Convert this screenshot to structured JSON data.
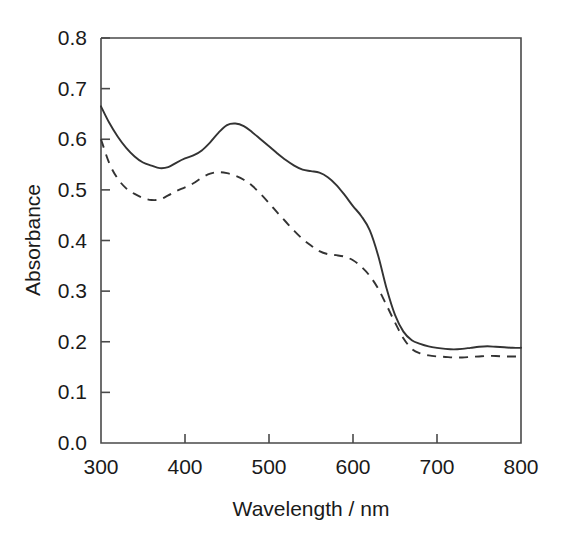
{
  "chart_data": {
    "type": "line",
    "title": "",
    "xlabel": "Wavelength / nm",
    "ylabel": "Absorbance",
    "xlim": [
      300,
      800
    ],
    "ylim": [
      0.0,
      0.8
    ],
    "xticks": [
      300,
      400,
      500,
      600,
      700,
      800
    ],
    "yticks": [
      "0.0",
      "0.1",
      "0.2",
      "0.3",
      "0.4",
      "0.5",
      "0.6",
      "0.7",
      "0.8"
    ],
    "xtick_labels": [
      "300",
      "400",
      "500",
      "600",
      "700",
      "800"
    ],
    "grid": false,
    "legend": "none",
    "axis_color": "#4a4a4a",
    "series_color": "#333333",
    "x": [
      300,
      310,
      320,
      330,
      340,
      350,
      360,
      370,
      380,
      390,
      400,
      410,
      420,
      430,
      440,
      450,
      460,
      470,
      480,
      490,
      500,
      510,
      520,
      530,
      540,
      550,
      560,
      570,
      580,
      590,
      600,
      610,
      620,
      630,
      640,
      650,
      660,
      670,
      680,
      690,
      700,
      710,
      720,
      730,
      740,
      750,
      760,
      770,
      780,
      790,
      800
    ],
    "series": [
      {
        "name": "solid-curve",
        "style": "solid",
        "values": [
          0.665,
          0.632,
          0.605,
          0.583,
          0.566,
          0.554,
          0.548,
          0.543,
          0.545,
          0.554,
          0.562,
          0.568,
          0.578,
          0.594,
          0.613,
          0.628,
          0.631,
          0.626,
          0.614,
          0.6,
          0.586,
          0.572,
          0.559,
          0.548,
          0.54,
          0.537,
          0.534,
          0.525,
          0.51,
          0.49,
          0.468,
          0.448,
          0.42,
          0.37,
          0.305,
          0.253,
          0.22,
          0.203,
          0.196,
          0.191,
          0.188,
          0.186,
          0.185,
          0.186,
          0.188,
          0.19,
          0.191,
          0.19,
          0.189,
          0.188,
          0.188
        ]
      },
      {
        "name": "dashed-curve",
        "style": "dashed",
        "values": [
          0.6,
          0.552,
          0.522,
          0.503,
          0.492,
          0.484,
          0.48,
          0.481,
          0.489,
          0.498,
          0.505,
          0.513,
          0.524,
          0.532,
          0.535,
          0.533,
          0.528,
          0.52,
          0.508,
          0.492,
          0.474,
          0.455,
          0.437,
          0.419,
          0.403,
          0.39,
          0.379,
          0.373,
          0.371,
          0.368,
          0.361,
          0.348,
          0.33,
          0.305,
          0.272,
          0.238,
          0.207,
          0.186,
          0.177,
          0.173,
          0.171,
          0.17,
          0.169,
          0.169,
          0.17,
          0.171,
          0.172,
          0.172,
          0.171,
          0.171,
          0.171
        ]
      }
    ]
  }
}
